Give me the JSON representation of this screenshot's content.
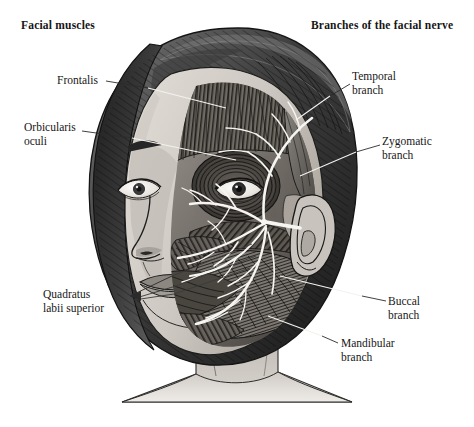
{
  "figure": {
    "title_left": "Facial muscles",
    "title_right": "Branches of the facial nerve",
    "background_color": "#ffffff",
    "text_color": "#171717"
  },
  "labels": {
    "muscles": [
      {
        "id": "frontalis",
        "text": "Frontalis",
        "side": "left"
      },
      {
        "id": "orbicularis-oculi",
        "text": "Orbicularis\noculi",
        "side": "left"
      },
      {
        "id": "quadratus-labii-superior",
        "text": "Quadratus\nlabii superior",
        "side": "left"
      }
    ],
    "nerve_branches": [
      {
        "id": "temporal-branch",
        "text": "Temporal\nbranch",
        "side": "right"
      },
      {
        "id": "zygomatic-branch",
        "text": "Zygomatic\nbranch",
        "side": "right"
      },
      {
        "id": "buccal-branch",
        "text": "Buccal\nbranch",
        "side": "right"
      },
      {
        "id": "mandibular-branch",
        "text": "Mandibular\nbranch",
        "side": "right"
      }
    ]
  },
  "illustration_colors": {
    "hair_dark": "#2d2d2d",
    "hair_mid": "#595959",
    "hair_light": "#8f8f8f",
    "skin_light": "#d6d2cc",
    "skin_mid": "#b4b0aa",
    "skin_shadow": "#8d8984",
    "muscle_dark": "#3a3a3a",
    "muscle_mid": "#6b6b6b",
    "nerve_white": "#f7f7f4",
    "outline": "#1a1a1a",
    "leader_light": "#f2f2ee",
    "leader_dark": "#2a2a2a"
  }
}
